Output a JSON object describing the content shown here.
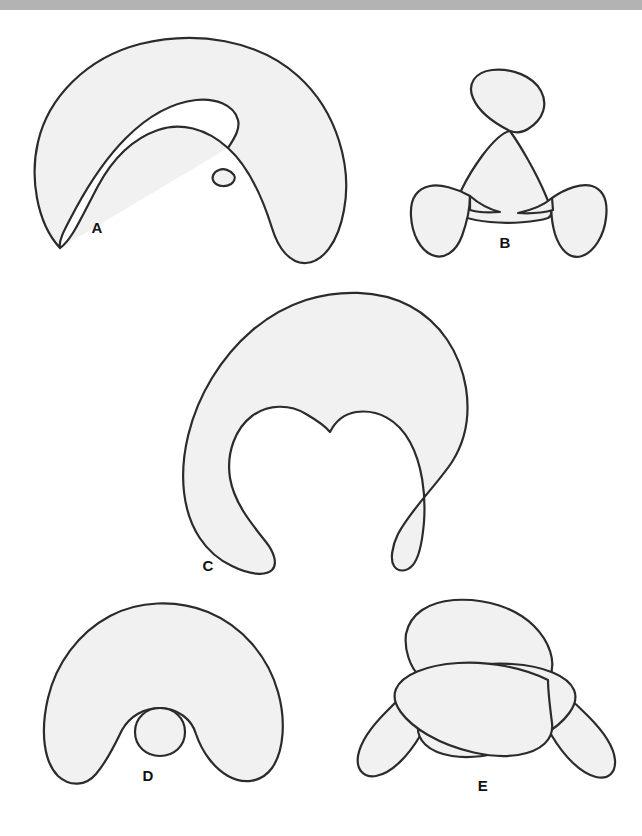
{
  "page": {
    "background_color": "#ffffff",
    "top_band_color": "#b3b3b3",
    "width": 642,
    "height": 836
  },
  "style": {
    "fill_color": "#f1f1f1",
    "stroke_color": "#2b2b2b",
    "stroke_width": 2.2
  },
  "figure": {
    "type": "line-drawing-plate",
    "shapes": [
      {
        "id": "A",
        "label": "A",
        "label_x": 97,
        "label_y": 233,
        "description": "crescent / horseshoe arch with a small inner spiral loop on the right side",
        "self_intersections": 1,
        "bbox": [
          30,
          40,
          355,
          270
        ]
      },
      {
        "id": "B",
        "label": "B",
        "label_x": 505,
        "label_y": 248,
        "description": "three-lobed trefoil-like curve with two crossings",
        "self_intersections": 3,
        "bbox": [
          413,
          78,
          607,
          258
        ]
      },
      {
        "id": "C",
        "label": "C",
        "label_x": 208,
        "label_y": 571,
        "description": "large disc with a deep U-shaped notch cut into the bottom ending in a cusp",
        "self_intersections": 0,
        "bbox": [
          175,
          295,
          470,
          578
        ]
      },
      {
        "id": "D",
        "label": "D",
        "label_x": 148,
        "label_y": 781,
        "description": "arch with a small circle tangent to the apex of the inner curve",
        "self_intersections": 2,
        "bbox": [
          45,
          604,
          285,
          795
        ]
      },
      {
        "id": "E",
        "label": "E",
        "label_x": 483,
        "label_y": 791,
        "description": "dome with two descending side lobes and two crossing lens-shaped loops",
        "self_intersections": 2,
        "bbox": [
          355,
          600,
          625,
          785
        ]
      }
    ]
  }
}
